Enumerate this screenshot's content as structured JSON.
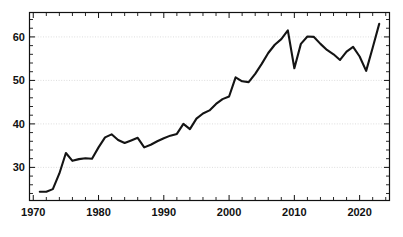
{
  "chart_data": {
    "type": "line",
    "title": "",
    "subtitle": "",
    "xlabel": "",
    "ylabel": "",
    "xlim": [
      1969.5,
      2024.5
    ],
    "ylim": [
      22.5,
      65.5
    ],
    "grid": true,
    "grid_axis": "y",
    "legend": false,
    "legend_position": "none",
    "line_color": "#141414",
    "grid_color": "#cfcfcf",
    "axis_color": "#111111",
    "background_color": "#ffffff",
    "x_major_ticks": [
      1970,
      1980,
      1990,
      2000,
      2010,
      2020
    ],
    "x_major_tick_labels": [
      "1970",
      "1980",
      "1990",
      "2000",
      "2010",
      "2020"
    ],
    "x_minor_tick_step": 2,
    "y_major_ticks": [
      30,
      40,
      50,
      60
    ],
    "y_major_tick_labels": [
      "30",
      "40",
      "50",
      "60"
    ],
    "y_minor_tick_step": 2,
    "x": [
      1971,
      1972,
      1973,
      1974,
      1975,
      1976,
      1977,
      1978,
      1979,
      1980,
      1981,
      1982,
      1983,
      1984,
      1985,
      1986,
      1987,
      1988,
      1989,
      1990,
      1991,
      1992,
      1993,
      1994,
      1995,
      1996,
      1997,
      1998,
      1999,
      2000,
      2001,
      2002,
      2003,
      2004,
      2005,
      2006,
      2007,
      2008,
      2009,
      2010,
      2011,
      2012,
      2013,
      2014,
      2015,
      2016,
      2017,
      2018,
      2019,
      2020,
      2021,
      2022,
      2023
    ],
    "values": [
      24.4,
      24.4,
      25.0,
      28.6,
      33.3,
      31.5,
      31.9,
      32.1,
      32.0,
      34.6,
      36.9,
      37.6,
      36.3,
      35.6,
      36.2,
      36.8,
      34.6,
      35.2,
      36.0,
      36.7,
      37.3,
      37.7,
      40.0,
      38.8,
      41.2,
      42.4,
      43.1,
      44.6,
      45.7,
      46.3,
      50.7,
      49.8,
      49.6,
      51.5,
      53.8,
      56.3,
      58.2,
      59.5,
      61.5,
      52.8,
      58.4,
      60.1,
      60.0,
      58.4,
      57.0,
      56.0,
      54.7,
      56.6,
      57.7,
      55.5,
      52.2,
      57.5,
      63.0
    ],
    "series_name": "series-1",
    "annotations": []
  }
}
